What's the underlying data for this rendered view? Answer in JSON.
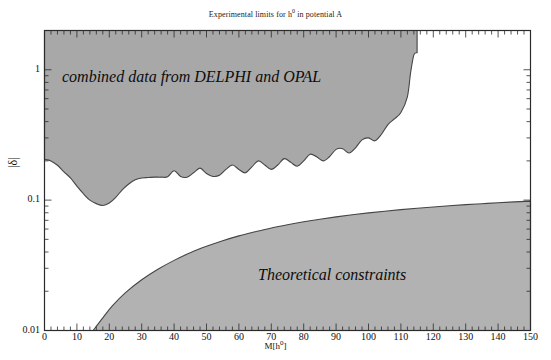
{
  "figure": {
    "title_prefix": "Experimental limits for h",
    "title_sup": "0",
    "title_suffix": " in potential A"
  },
  "axes": {
    "x": {
      "label_prefix": "M[h",
      "label_sup": "0",
      "label_suffix": "]",
      "min": 0,
      "max": 150,
      "scale": "linear",
      "ticks": [
        0,
        10,
        20,
        30,
        40,
        50,
        60,
        70,
        80,
        90,
        100,
        110,
        120,
        130,
        140,
        150
      ],
      "minor_tick_step": 2
    },
    "y": {
      "label": "|δ|",
      "min": 0.01,
      "max": 2.0,
      "scale": "log",
      "ticks": [
        1,
        0.1,
        0.01
      ],
      "tick_labels": [
        "1",
        "0.1",
        "0.01"
      ]
    }
  },
  "colors": {
    "fill": "#a8a8a8",
    "fill_theory": "#b4b4b4",
    "stroke": "#4a4a4a",
    "axis": "#2b2b2b",
    "background": "#ffffff",
    "text": "#111111"
  },
  "annotations": [
    {
      "name": "combined-data-label",
      "text": "combined data from DELPHI and OPAL",
      "x": 62,
      "y": 68
    },
    {
      "name": "theoretical-constraints-label",
      "text": "Theoretical constraints",
      "x": 258,
      "y": 266
    }
  ],
  "chart_data": {
    "type": "area",
    "title": "Experimental limits for h0 in potential A",
    "xlabel": "M[h0]",
    "ylabel": "|delta|",
    "xlim": [
      0,
      150
    ],
    "ylim": [
      0.01,
      2.0
    ],
    "yscale": "log",
    "xscale": "linear",
    "grid": false,
    "legend": "none",
    "series": [
      {
        "name": "Experimental exclusion (combined DELPHI + OPAL)",
        "fill_direction": "above-curve",
        "description": "Excluded region lies above the jagged boundary; region ends abruptly near M=115 GeV",
        "x": [
          0,
          2,
          4,
          6,
          8,
          10,
          12,
          14,
          16,
          18,
          20,
          22,
          24,
          26,
          28,
          30,
          32,
          34,
          36,
          38,
          40,
          42,
          44,
          46,
          48,
          50,
          52,
          54,
          56,
          58,
          60,
          62,
          64,
          66,
          68,
          70,
          72,
          74,
          76,
          78,
          80,
          82,
          84,
          86,
          88,
          90,
          92,
          94,
          96,
          98,
          100,
          102,
          104,
          106,
          108,
          110,
          112,
          113,
          114,
          115
        ],
        "y": [
          0.205,
          0.2,
          0.185,
          0.165,
          0.148,
          0.128,
          0.112,
          0.1,
          0.094,
          0.091,
          0.095,
          0.105,
          0.12,
          0.133,
          0.143,
          0.148,
          0.149,
          0.15,
          0.15,
          0.151,
          0.168,
          0.152,
          0.15,
          0.162,
          0.176,
          0.16,
          0.152,
          0.155,
          0.172,
          0.186,
          0.172,
          0.162,
          0.18,
          0.2,
          0.186,
          0.172,
          0.186,
          0.208,
          0.195,
          0.182,
          0.2,
          0.225,
          0.215,
          0.2,
          0.216,
          0.245,
          0.248,
          0.23,
          0.252,
          0.29,
          0.3,
          0.285,
          0.32,
          0.38,
          0.42,
          0.47,
          0.62,
          0.95,
          1.3,
          1.35
        ]
      },
      {
        "name": "Theoretical constraints",
        "fill_direction": "below-curve",
        "description": "Allowed-exclusion region below the smooth rising curve; curve meets bottom axis near M=15 GeV",
        "x": [
          15,
          18,
          21,
          25,
          30,
          35,
          40,
          45,
          50,
          55,
          60,
          65,
          70,
          75,
          80,
          85,
          90,
          95,
          100,
          105,
          110,
          115,
          120,
          125,
          130,
          135,
          140,
          145,
          150
        ],
        "y": [
          0.01,
          0.0125,
          0.0155,
          0.0195,
          0.0245,
          0.0295,
          0.0345,
          0.0395,
          0.0442,
          0.0488,
          0.0532,
          0.0572,
          0.0612,
          0.0648,
          0.0682,
          0.0714,
          0.0744,
          0.0772,
          0.0798,
          0.0822,
          0.0845,
          0.0866,
          0.0886,
          0.0905,
          0.0923,
          0.0939,
          0.0955,
          0.0969,
          0.0983
        ]
      }
    ]
  }
}
